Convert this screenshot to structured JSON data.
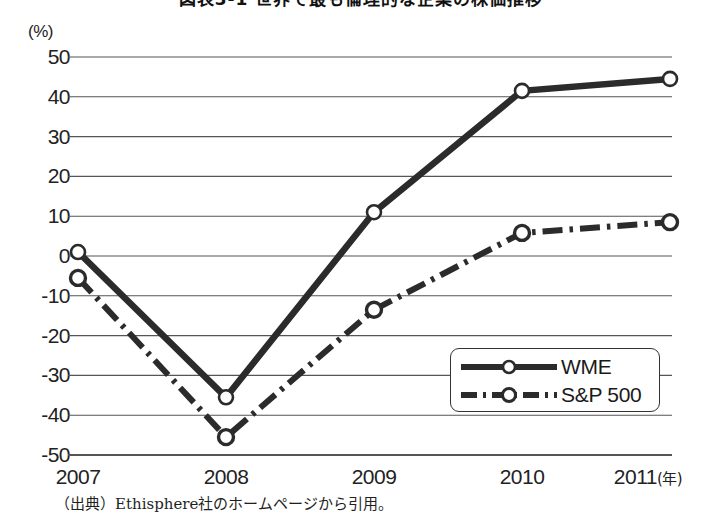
{
  "figure": {
    "title": "図表3-1 世界で最も倫理的な企業の株価推移",
    "title_clipped": true,
    "source_note": "（出典）Ethisphere社のホームページから引用。"
  },
  "legend": {
    "position": "inside-bottom-right",
    "entries": [
      {
        "label": "WME",
        "style": "solid",
        "marker": "open-circle"
      },
      {
        "label": "S&P 500",
        "style": "dash-dot",
        "marker": "open-circle"
      }
    ]
  },
  "colors": {
    "line": "#2b2b2b",
    "grid": "#555555",
    "marker_fill": "#ffffff",
    "background": "#ffffff",
    "text": "#1c1c1c"
  },
  "chart_data": {
    "type": "line",
    "title": "図表3-1 世界で最も倫理的な企業の株価推移",
    "xlabel": "(年)",
    "ylabel": "(%)",
    "unit_label": "(%)",
    "x_unit_label": "(年)",
    "categories": [
      "2007",
      "2008",
      "2009",
      "2010",
      "2011"
    ],
    "x_tick_labels": [
      "2007",
      "2008",
      "2009",
      "2010",
      "2011"
    ],
    "y_tick_labels": [
      "50",
      "40",
      "30",
      "20",
      "10",
      "0",
      "-10",
      "-20",
      "-30",
      "-40",
      "-50"
    ],
    "y_ticks": [
      50,
      40,
      30,
      20,
      10,
      0,
      -10,
      -20,
      -30,
      -40,
      -50
    ],
    "ylim": [
      -50,
      50
    ],
    "grid": true,
    "grid_axis": "y",
    "legend_position": "lower right",
    "series": [
      {
        "name": "WME",
        "style": "solid",
        "marker": "open-circle",
        "values": [
          1,
          -35.5,
          11,
          41.5,
          44.5
        ]
      },
      {
        "name": "S&P 500",
        "style": "dash-dot",
        "marker": "open-circle",
        "values": [
          -5.5,
          -45.5,
          -13.5,
          5.8,
          8.5
        ]
      }
    ]
  }
}
